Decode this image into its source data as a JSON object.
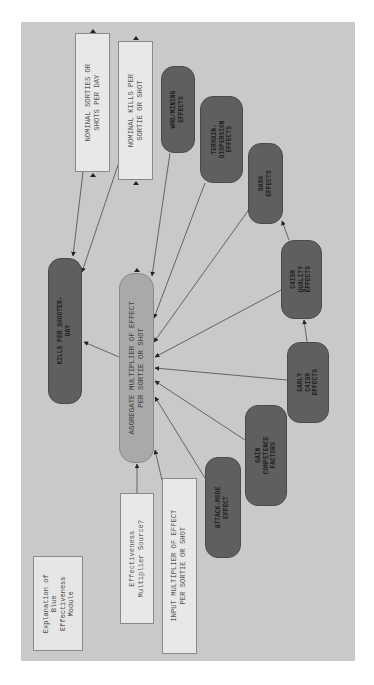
{
  "diagram": {
    "title": "Explanation of\nBlue\nEffectiveness\nModule",
    "orientation": "rotated -90deg (text reads bottom-to-top)",
    "colors": {
      "background": "#c9c9c9",
      "input_box": "#e8e8e8",
      "effect_node": "#5f5f5f",
      "aggregate_node": "#a9a9a9",
      "edge": "#4a4a4a"
    },
    "nodes": {
      "nominal_sorties": "NOMINAL SORTIES OR\nSHOTS PER DAY",
      "nominal_kills": "NOMINAL KILLS PER\nSORTIE OR SHOT",
      "wmd_mining": "WMD/MINING\nEFFECTS",
      "terrain_dispersion": "TERRAIN-\nDISPERSION\nEFFECTS",
      "dash": "DASH\nEFFECTS",
      "c4isr_quality": "C4ISR\nQUALITY\nEFFECTS",
      "early_c4isr": "EARLY\nC4ISR\nEFFECTS",
      "gain_competence": "GAIN\nCOMPETENCE\nFACTORS",
      "attack_mode": "ATTACK-MODE\nEFFECT",
      "kills_per_shooter_day": "KILLS PER SHOOTER-\nDAY",
      "aggregate_multiplier": "AGGREGATE MULTIPLIER OF EFFECT\nPER SORTIE OR SHOT",
      "multiplier_source": "Effectiveness\nMultiplier Source?",
      "input_multiplier": "INPUT MULTIPLIER OF EFFECT\nPER SORTIE OR SHOT",
      "explanation": "Explanation of\nBlue\nEffectiveness\nModule"
    },
    "edges": [
      {
        "from": "nominal_sorties",
        "to": "kills_per_shooter_day"
      },
      {
        "from": "nominal_kills",
        "to": "kills_per_shooter_day"
      },
      {
        "from": "aggregate_multiplier",
        "to": "kills_per_shooter_day"
      },
      {
        "from": "wmd_mining",
        "to": "aggregate_multiplier"
      },
      {
        "from": "terrain_dispersion",
        "to": "aggregate_multiplier"
      },
      {
        "from": "dash",
        "to": "aggregate_multiplier"
      },
      {
        "from": "c4isr_quality",
        "to": "aggregate_multiplier"
      },
      {
        "from": "early_c4isr",
        "to": "aggregate_multiplier"
      },
      {
        "from": "gain_competence",
        "to": "aggregate_multiplier"
      },
      {
        "from": "attack_mode",
        "to": "aggregate_multiplier"
      },
      {
        "from": "multiplier_source",
        "to": "aggregate_multiplier"
      },
      {
        "from": "input_multiplier",
        "to": "aggregate_multiplier"
      },
      {
        "from": "early_c4isr",
        "to": "c4isr_quality"
      },
      {
        "from": "c4isr_quality",
        "to": "dash"
      }
    ]
  }
}
